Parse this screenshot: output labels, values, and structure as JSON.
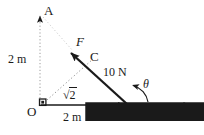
{
  "figure": {
    "type": "physics-vector-diagram",
    "background_color": "#ffffff",
    "ink_color": "#1a1a1a",
    "points": {
      "origin": {
        "label": "O",
        "x": 40,
        "y": 105
      },
      "top": {
        "label": "A",
        "x": 40,
        "y": 13
      },
      "mid": {
        "label": "C",
        "x": 94,
        "y": 57
      },
      "right": {
        "label": "B",
        "x": 128,
        "y": 105
      }
    },
    "labels": {
      "vertical_distance": "2 m",
      "horizontal_distance": "2 m",
      "force_magnitude": "10 N",
      "diagonal_length_radical": "√",
      "diagonal_length_value": "2",
      "angle": "θ",
      "force_vector_symbol": "F",
      "displacement_vector_symbol": "r"
    },
    "vectors": [
      {
        "name": "force-vector",
        "symbol": "F",
        "magnitude": "10 N",
        "from": [
          128,
          105
        ],
        "to": [
          68,
          50
        ],
        "style": "solid-thick"
      },
      {
        "name": "displacement-vector",
        "symbol": "r",
        "magnitude": "2 m",
        "from": [
          40,
          105
        ],
        "to": [
          128,
          105
        ],
        "style": "solid-thin"
      }
    ],
    "construction_lines": [
      {
        "name": "vertical-axis-dotted",
        "from": [
          40,
          105
        ],
        "to": [
          40,
          13
        ],
        "style": "dotted",
        "arrow": true
      },
      {
        "name": "horizontal-ray-dotted",
        "from": [
          128,
          105
        ],
        "to": [
          193,
          105
        ],
        "style": "dotted",
        "arrow": true
      },
      {
        "name": "origin-to-c-dotted",
        "from": [
          46,
          101
        ],
        "to": [
          92,
          60
        ],
        "style": "dotted",
        "arrow": false
      },
      {
        "name": "a-to-c-dotted",
        "from": [
          42,
          16
        ],
        "to": [
          72,
          50
        ],
        "style": "dotted",
        "arrow": false
      }
    ],
    "markers": {
      "right_angle_at_origin": true,
      "angle_arc_at_b": true
    }
  }
}
